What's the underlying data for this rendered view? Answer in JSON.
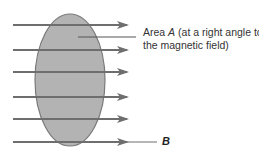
{
  "diagram": {
    "area_label": {
      "line1_prefix": "Area ",
      "line1_var": "A",
      "line1_suffix": " (at a right angle to",
      "line2": "the magnetic field)"
    },
    "field_label": "B",
    "field_lines_count": 6,
    "colors": {
      "area_fill": "#b3b3b3",
      "area_stroke": "#7a7a7a",
      "field_line": "#6e6e6e",
      "text": "#333333"
    }
  }
}
